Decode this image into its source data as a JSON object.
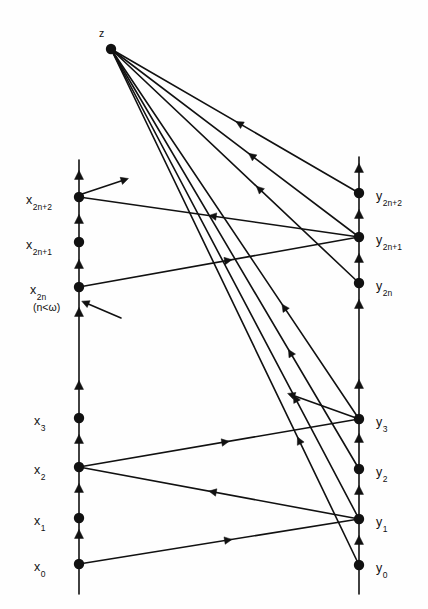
{
  "figure": {
    "type": "directed-graph-diagram",
    "background_color": "#ffffff",
    "stroke_color": "#111111",
    "node_color": "#111111"
  },
  "apex": {
    "id": "z",
    "label": "z",
    "x": 111,
    "y": 49,
    "label_x": 99,
    "label_y": 27
  },
  "left_chain": {
    "axis_x": 79,
    "axis_top": 160,
    "axis_bottom": 594,
    "label_anchor_x": 62,
    "nodes": [
      {
        "id": "x0",
        "base": "x",
        "sub": "0",
        "x": 79,
        "y": 564,
        "label_x": 34,
        "label_y": 557
      },
      {
        "id": "x1",
        "base": "x",
        "sub": "1",
        "x": 79,
        "y": 518,
        "label_x": 34,
        "label_y": 511
      },
      {
        "id": "x2",
        "base": "x",
        "sub": "2",
        "x": 79,
        "y": 467,
        "label_x": 34,
        "label_y": 460
      },
      {
        "id": "x3",
        "base": "x",
        "sub": "3",
        "x": 79,
        "y": 418,
        "label_x": 34,
        "label_y": 411
      },
      {
        "id": "x2n",
        "base": "x",
        "sub": "2n",
        "x": 79,
        "y": 287,
        "label_x": 30,
        "label_y": 280
      },
      {
        "id": "x2n1",
        "base": "x",
        "sub": "2n+1",
        "x": 79,
        "y": 242,
        "label_x": 26,
        "label_y": 235
      },
      {
        "id": "x2n2",
        "base": "x",
        "sub": "2n+2",
        "x": 79,
        "y": 197,
        "label_x": 26,
        "label_y": 190
      }
    ],
    "note": {
      "text": "(n<ω)",
      "x": 33,
      "y": 301
    }
  },
  "right_chain": {
    "axis_x": 359,
    "axis_top": 157,
    "axis_bottom": 594,
    "label_anchor_x": 376,
    "nodes": [
      {
        "id": "y0",
        "base": "y",
        "sub": "0",
        "x": 359,
        "y": 565,
        "label_x": 376,
        "label_y": 558
      },
      {
        "id": "y1",
        "base": "y",
        "sub": "1",
        "x": 359,
        "y": 519,
        "label_x": 376,
        "label_y": 512
      },
      {
        "id": "y2",
        "base": "y",
        "sub": "2",
        "x": 359,
        "y": 469,
        "label_x": 376,
        "label_y": 462
      },
      {
        "id": "y3",
        "base": "y",
        "sub": "3",
        "x": 359,
        "y": 419,
        "label_x": 376,
        "label_y": 412
      },
      {
        "id": "y2n",
        "base": "y",
        "sub": "2n",
        "x": 359,
        "y": 283,
        "label_x": 376,
        "label_y": 276
      },
      {
        "id": "y2n1",
        "base": "y",
        "sub": "2n+1",
        "x": 359,
        "y": 237,
        "label_x": 376,
        "label_y": 230
      },
      {
        "id": "y2n2",
        "base": "y",
        "sub": "2n+2",
        "x": 359,
        "y": 193,
        "label_x": 376,
        "label_y": 186
      }
    ]
  },
  "chain_arrows": {
    "left": [
      {
        "x": 79,
        "y": 176
      },
      {
        "x": 79,
        "y": 220
      },
      {
        "x": 79,
        "y": 265
      },
      {
        "x": 79,
        "y": 313
      },
      {
        "x": 79,
        "y": 386
      },
      {
        "x": 79,
        "y": 440
      },
      {
        "x": 79,
        "y": 489
      },
      {
        "x": 79,
        "y": 535
      }
    ],
    "right": [
      {
        "x": 359,
        "y": 169
      },
      {
        "x": 359,
        "y": 215
      },
      {
        "x": 359,
        "y": 259
      },
      {
        "x": 359,
        "y": 305
      },
      {
        "x": 359,
        "y": 385
      },
      {
        "x": 359,
        "y": 439
      },
      {
        "x": 359,
        "y": 491
      },
      {
        "x": 359,
        "y": 541
      }
    ]
  },
  "cross_edges": [
    {
      "id": "x0-to-y1",
      "from": "x0",
      "to": "y1",
      "x1": 79,
      "y1": 564,
      "x2": 359,
      "y2": 519,
      "arrow_t": 0.53,
      "arrow_dir": "forward"
    },
    {
      "id": "y1-to-x2",
      "from": "y1",
      "to": "x2",
      "x1": 359,
      "y1": 519,
      "x2": 79,
      "y2": 467,
      "arrow_t": 0.52,
      "arrow_dir": "forward"
    },
    {
      "id": "x2-to-y3",
      "from": "x2",
      "to": "y3",
      "x1": 79,
      "y1": 467,
      "x2": 359,
      "y2": 419,
      "arrow_t": 0.52,
      "arrow_dir": "forward"
    },
    {
      "id": "x2n-to-y2n1",
      "from": "x2n",
      "to": "y2n1",
      "x1": 79,
      "y1": 287,
      "x2": 359,
      "y2": 237,
      "arrow_t": 0.53,
      "arrow_dir": "forward"
    },
    {
      "id": "y2n1-to-x2n2",
      "from": "y2n1",
      "to": "x2n2",
      "x1": 359,
      "y1": 237,
      "x2": 79,
      "y2": 197,
      "arrow_t": 0.52,
      "arrow_dir": "forward"
    },
    {
      "id": "y3-to-dangle",
      "from": "y3",
      "to": "free",
      "x1": 359,
      "y1": 419,
      "x2": 292,
      "y2": 395,
      "arrow_t": 1.0,
      "arrow_dir": "forward"
    }
  ],
  "dangling_arrows": [
    {
      "id": "x2n2-outgoing",
      "x1": 82,
      "y1": 194,
      "x2": 124,
      "y2": 180,
      "arrow_dir": "forward"
    },
    {
      "id": "x2n-incoming",
      "x1": 121,
      "y1": 318,
      "x2": 86,
      "y2": 303,
      "arrow_dir": "forward"
    }
  ],
  "fan_edges": [
    {
      "id": "y2n2-to-z",
      "from": "y2n2",
      "to": "z",
      "x1": 359,
      "y1": 193,
      "x2": 111,
      "y2": 49,
      "arrow_t": 0.48
    },
    {
      "id": "y2n1-to-z",
      "from": "y2n1",
      "to": "z",
      "x1": 359,
      "y1": 237,
      "x2": 111,
      "y2": 49,
      "arrow_t": 0.43
    },
    {
      "id": "y2n-to-z",
      "from": "y2n",
      "to": "z",
      "x1": 359,
      "y1": 283,
      "x2": 111,
      "y2": 49,
      "arrow_t": 0.4
    },
    {
      "id": "y3-to-z",
      "from": "y3",
      "to": "z",
      "x1": 359,
      "y1": 419,
      "x2": 111,
      "y2": 49,
      "arrow_t": 0.3
    },
    {
      "id": "y2-to-z",
      "from": "y2",
      "to": "z",
      "x1": 359,
      "y1": 469,
      "x2": 111,
      "y2": 49,
      "arrow_t": 0.275
    },
    {
      "id": "y1-to-z",
      "from": "y1",
      "to": "z",
      "x1": 359,
      "y1": 519,
      "x2": 111,
      "y2": 49,
      "arrow_t": 0.255
    },
    {
      "id": "y0-to-z",
      "from": "y0",
      "to": "z",
      "x1": 359,
      "y1": 565,
      "x2": 111,
      "y2": 49,
      "arrow_t": 0.24
    }
  ],
  "style": {
    "node_radius": 5.2,
    "line_width": 1.6,
    "arrow_size": 7.5
  }
}
